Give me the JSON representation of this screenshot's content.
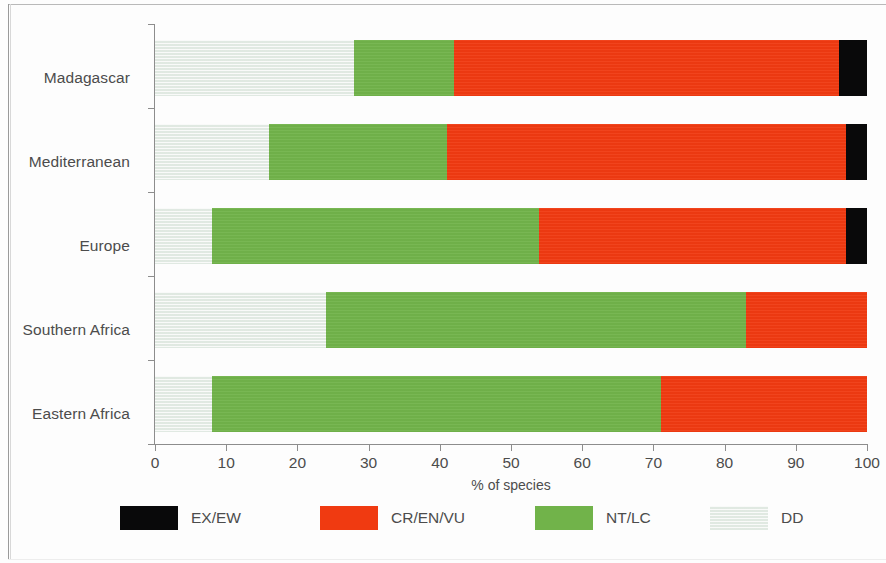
{
  "chart_data": {
    "type": "bar",
    "orientation": "horizontal",
    "stacked": true,
    "title": "",
    "xlabel": "% of species",
    "ylabel": "",
    "xlim": [
      0,
      100
    ],
    "xticks": [
      0,
      10,
      20,
      30,
      40,
      50,
      60,
      70,
      80,
      90,
      100
    ],
    "xticklabels": [
      "0",
      "10",
      "20",
      "30",
      "40",
      "50",
      "60",
      "70",
      "80",
      "90",
      "100"
    ],
    "grid": false,
    "legend_position": "bottom",
    "categories": [
      "Madagascar",
      "Mediterranean",
      "Europe",
      "Southern Africa",
      "Eastern Africa"
    ],
    "series": [
      {
        "name": "DD",
        "color": "#e7ece7",
        "values": [
          28,
          16,
          8,
          24,
          8
        ]
      },
      {
        "name": "NT/LC",
        "color": "#71b34a",
        "values": [
          14,
          25,
          46,
          59,
          63
        ]
      },
      {
        "name": "CR/EN/VU",
        "color": "#f03a11",
        "values": [
          54,
          56,
          43,
          17,
          29
        ]
      },
      {
        "name": "EX/EW",
        "color": "#09090a",
        "values": [
          4,
          3,
          3,
          0,
          0
        ]
      }
    ],
    "stack_order": [
      "DD",
      "NT/LC",
      "CR/EN/VU",
      "EX/EW"
    ],
    "legend": [
      {
        "label": "EX/EW",
        "color": "#09090a"
      },
      {
        "label": "CR/EN/VU",
        "color": "#f03a11"
      },
      {
        "label": "NT/LC",
        "color": "#71b34a"
      },
      {
        "label": "DD",
        "color": "#e7ece7"
      }
    ]
  },
  "axis": {
    "x_title": "% of species",
    "ticks": [
      "0",
      "10",
      "20",
      "30",
      "40",
      "50",
      "60",
      "70",
      "80",
      "90",
      "100"
    ]
  },
  "rows": [
    {
      "label": "Madagascar",
      "dd": 28,
      "ntlc": 14,
      "crenvu": 54,
      "exew": 4
    },
    {
      "label": "Mediterranean",
      "dd": 16,
      "ntlc": 25,
      "crenvu": 56,
      "exew": 3
    },
    {
      "label": "Europe",
      "dd": 8,
      "ntlc": 46,
      "crenvu": 43,
      "exew": 3
    },
    {
      "label": "Southern Africa",
      "dd": 24,
      "ntlc": 59,
      "crenvu": 17,
      "exew": 0
    },
    {
      "label": "Eastern Africa",
      "dd": 8,
      "ntlc": 63,
      "crenvu": 29,
      "exew": 0
    }
  ],
  "legend": {
    "items": [
      {
        "label": "EX/EW"
      },
      {
        "label": "CR/EN/VU"
      },
      {
        "label": "NT/LC"
      },
      {
        "label": "DD"
      }
    ]
  }
}
